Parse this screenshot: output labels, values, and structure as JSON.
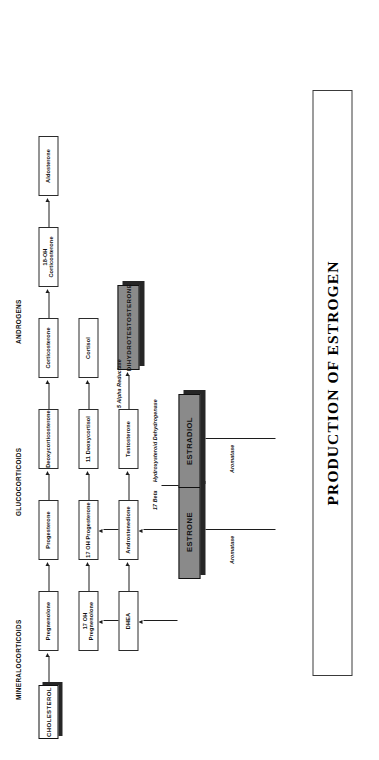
{
  "title": {
    "text": "PRODUCTION OF ESTROGEN"
  },
  "columns": [
    {
      "id": "mineralocorticoids",
      "label": "MINERALOCORTICOIDS"
    },
    {
      "id": "glucocorticoids",
      "label": "GLUCOCORTICOIDS"
    },
    {
      "id": "androgens",
      "label": "ANDROGENS"
    }
  ],
  "nodes": {
    "cholesterol": "CHOLESTEROL",
    "pregnenolone": "Pregnenolone",
    "progesterone": "Progesterone",
    "deoxycorticosterone": "Deoxycorticosterone",
    "corticosterone": "Corticosterone",
    "oh18_corticosterone": "18-OH Corticosterone",
    "aldosterone": "Aldosterone",
    "oh17_pregnenolone": "17 OH Pregnenolone",
    "oh17_progesterone": "17 OH Progesterone",
    "deoxycortisol11": "11 Deoxycortisol",
    "cortisol": "Cortisol",
    "dhea": "DHEA",
    "androstenedione": "Androstenedione",
    "testosterone": "Testosterone",
    "dihydrotestosterone": "DIHYDROTESTOSTERONE",
    "estrone": "ESTRONE",
    "estradiol": "ESTRADIOL"
  },
  "enzymes": {
    "aromatase_1": "Aromatase",
    "aromatase_2": "Aromatase",
    "five_alpha": "5 Alpha Reductase",
    "seventeen_beta": "17 Beta",
    "hsd": "Hydroxysteroid Dehydrogenase"
  },
  "colors": {
    "box_fill": "#ffffff",
    "emphasis_fill": "#8a8a8a",
    "shadow": "#262626",
    "stroke": "#2b2b2b",
    "text": "#111111",
    "page_bg": "#ffffff"
  }
}
